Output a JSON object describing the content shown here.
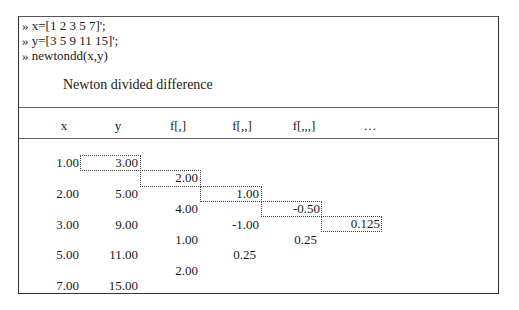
{
  "console": {
    "lines": [
      "» x=[1 2 3 5 7]';",
      "» y=[3 5 9 11 15]';",
      "» newtondd(x,y)"
    ]
  },
  "table": {
    "title": "Newton divided difference",
    "headers": [
      "x",
      "y",
      "f[,]",
      "f[,,]",
      "f[,,,]",
      "…"
    ],
    "x": [
      "1.00",
      "2.00",
      "3.00",
      "5.00",
      "7.00"
    ],
    "y": [
      "3.00",
      "5.00",
      "9.00",
      "11.00",
      "15.00"
    ],
    "f1": [
      "2.00",
      "4.00",
      "1.00",
      "2.00"
    ],
    "f2": [
      "1.00",
      "-1.00",
      "0.25"
    ],
    "f3": [
      "-0.50",
      "0.25"
    ],
    "f4": [
      "0.125"
    ]
  }
}
